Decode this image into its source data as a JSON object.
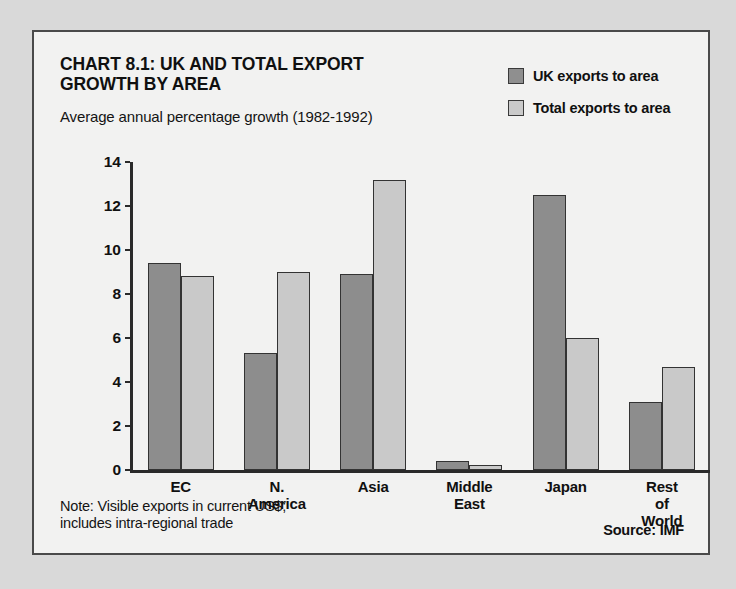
{
  "chart_data": {
    "type": "bar",
    "title": "CHART 8.1: UK AND TOTAL EXPORT\nGROWTH BY AREA",
    "subtitle": "Average annual percentage growth (1982-1992)",
    "xlabel": "",
    "ylabel": "",
    "ylim": [
      0,
      14
    ],
    "yticks": [
      0,
      2,
      4,
      6,
      8,
      10,
      12,
      14
    ],
    "grid": false,
    "legend_position": "top-right",
    "categories": [
      "EC",
      "N. America",
      "Asia",
      "Middle\nEast",
      "Japan",
      "Rest\nof World"
    ],
    "series": [
      {
        "name": "UK exports to area",
        "color": "#8d8d8d",
        "values": [
          9.4,
          5.3,
          8.9,
          0.4,
          12.5,
          3.1
        ]
      },
      {
        "name": "Total exports to area",
        "color": "#c9c9c9",
        "values": [
          8.8,
          9.0,
          13.2,
          0.25,
          6.0,
          4.7
        ]
      }
    ],
    "note": "Note: Visible exports in current US$;\nincludes intra-regional trade",
    "source": "Source: IMF"
  }
}
